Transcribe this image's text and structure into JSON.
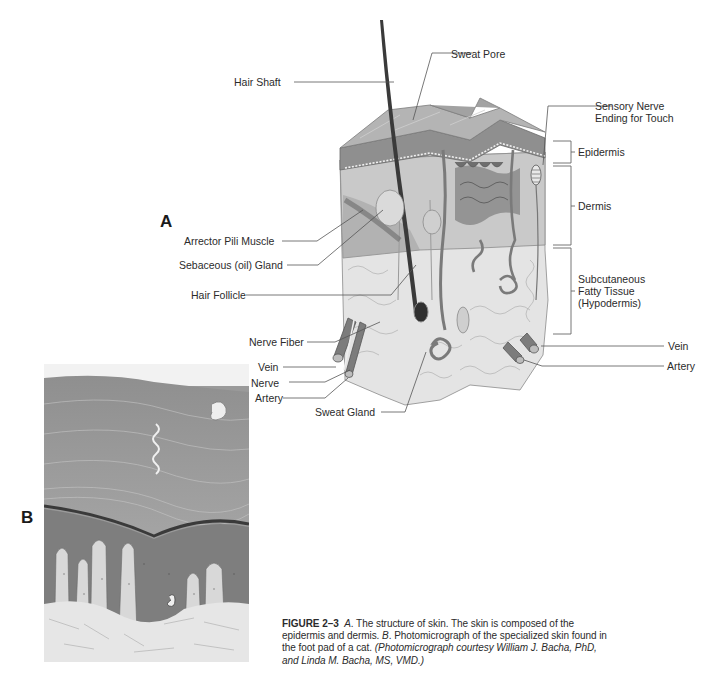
{
  "figure": {
    "panel_a_letter": "A",
    "panel_b_letter": "B",
    "labels_left": {
      "hair_shaft": "Hair Shaft",
      "arrector_pili": "Arrector Pili Muscle",
      "sebaceous_gland": "Sebaceous (oil) Gland",
      "hair_follicle": "Hair Follicle",
      "nerve_fiber": "Nerve Fiber",
      "vein": "Vein",
      "nerve": "Nerve",
      "artery": "Artery",
      "sweat_gland": "Sweat Gland"
    },
    "labels_top": {
      "sweat_pore": "Sweat Pore"
    },
    "labels_right": {
      "sensory_nerve_line1": "Sensory Nerve",
      "sensory_nerve_line2": "Ending for Touch",
      "epidermis": "Epidermis",
      "dermis": "Dermis",
      "subcutaneous_line1": "Subcutaneous",
      "subcutaneous_line2": "Fatty Tissue",
      "subcutaneous_line3": "(Hypodermis)",
      "vein": "Vein",
      "artery": "Artery"
    },
    "caption": {
      "figure_number": "FIGURE 2–3",
      "panel_a_ref": "A",
      "text_a": ". The structure of skin. The skin is composed of the epidermis and dermis. ",
      "panel_b_ref": "B",
      "text_b": ". Photomicrograph of the specialized skin found in the foot pad of a cat. ",
      "credit": "(Photomicrograph courtesy William J. Bacha, PhD, and Linda M. Bacha, MS, VMD.)"
    }
  },
  "colors": {
    "ink": "#2b2b2b",
    "leader_line": "#555555",
    "skin_surface": "#a8a8a8",
    "epidermis": "#8c8c8c",
    "dermis": "#b9b9b9",
    "fat": "#e2e2e2",
    "hair": "#3a3a3a",
    "micro_base": "#9a9a9a"
  }
}
